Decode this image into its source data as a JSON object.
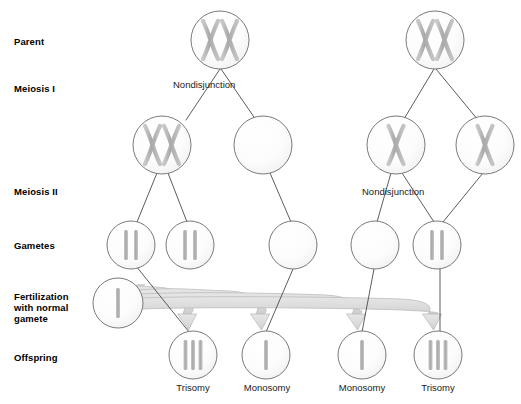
{
  "figure": {
    "background_color": "#ffffff",
    "circle_stroke": "#6b6b6b",
    "circle_fill": "#fbfbfb",
    "chromosome_color": "#b3b3b3",
    "line_color": "#4a4a4a",
    "arrow_fill": "#d9d9d9",
    "arrow_stroke": "#bdbdbd",
    "text_color": "#000000"
  },
  "row_labels": [
    {
      "id": "parent",
      "text": "Parent",
      "x": 14,
      "y": 36
    },
    {
      "id": "meiosis-i",
      "text": "Meiosis I",
      "x": 14,
      "y": 83
    },
    {
      "id": "meiosis-ii",
      "text": "Meiosis II",
      "x": 14,
      "y": 186
    },
    {
      "id": "gametes",
      "text": "Gametes",
      "x": 14,
      "y": 240
    },
    {
      "id": "fertilization",
      "text": "Fertilization\nwith normal\ngamete",
      "x": 14,
      "y": 291
    },
    {
      "id": "offspring",
      "text": "Offspring",
      "x": 14,
      "y": 352
    }
  ],
  "stage_captions": [
    {
      "id": "nondisjunction-meiosis-i",
      "text": "Nondisjunction",
      "x": 173,
      "y": 79
    },
    {
      "id": "nondisjunction-meiosis-ii",
      "text": "Nondisjunction",
      "x": 362,
      "y": 186
    }
  ],
  "outcome_labels": [
    {
      "id": "outcome-1",
      "text": "Trisomy",
      "x": 193,
      "y": 382
    },
    {
      "id": "outcome-2",
      "text": "Monosomy",
      "x": 267,
      "y": 382
    },
    {
      "id": "outcome-3",
      "text": "Monosomy",
      "x": 362,
      "y": 382
    },
    {
      "id": "outcome-4",
      "text": "Trisomy",
      "x": 438,
      "y": 382
    }
  ],
  "cells": [
    {
      "id": "parent-left",
      "name": "parent-cell-left",
      "cx": 220,
      "cy": 40,
      "r": 29,
      "content": "two-chromosomes"
    },
    {
      "id": "parent-right",
      "name": "parent-cell-right",
      "cx": 435,
      "cy": 40,
      "r": 29,
      "content": "two-chromosomes"
    },
    {
      "id": "mi-left-1",
      "name": "meiosis-i-cell-both",
      "cx": 162,
      "cy": 145,
      "r": 29,
      "content": "two-chromosomes"
    },
    {
      "id": "mi-left-2",
      "name": "meiosis-i-cell-empty",
      "cx": 263,
      "cy": 145,
      "r": 29,
      "content": "empty"
    },
    {
      "id": "mi-right-1",
      "name": "meiosis-i-cell-one-left",
      "cx": 396,
      "cy": 145,
      "r": 29,
      "content": "one-chromosome"
    },
    {
      "id": "mi-right-2",
      "name": "meiosis-i-cell-one-right",
      "cx": 485,
      "cy": 145,
      "r": 29,
      "content": "one-chromosome"
    },
    {
      "id": "gamete-1",
      "name": "gamete-disomic-1",
      "cx": 131,
      "cy": 245,
      "r": 24,
      "content": "two-chromatids"
    },
    {
      "id": "gamete-2",
      "name": "gamete-disomic-2",
      "cx": 190,
      "cy": 245,
      "r": 24,
      "content": "two-chromatids"
    },
    {
      "id": "gamete-3",
      "name": "gamete-nullisomic-1",
      "cx": 293,
      "cy": 245,
      "r": 24,
      "content": "empty"
    },
    {
      "id": "gamete-4",
      "name": "gamete-nullisomic-2",
      "cx": 375,
      "cy": 245,
      "r": 24,
      "content": "empty"
    },
    {
      "id": "gamete-5",
      "name": "gamete-disomic-3",
      "cx": 437,
      "cy": 245,
      "r": 24,
      "content": "two-chromatids"
    },
    {
      "id": "normal-gamete",
      "name": "normal-gamete-cell",
      "cx": 118,
      "cy": 303,
      "r": 25,
      "content": "one-chromatid"
    },
    {
      "id": "offspring-1",
      "name": "offspring-trisomy-1",
      "cx": 193,
      "cy": 355,
      "r": 24,
      "content": "three-chromatids"
    },
    {
      "id": "offspring-2",
      "name": "offspring-monosomy-1",
      "cx": 266,
      "cy": 355,
      "r": 24,
      "content": "one-chromatid"
    },
    {
      "id": "offspring-3",
      "name": "offspring-monosomy-2",
      "cx": 362,
      "cy": 355,
      "r": 24,
      "content": "one-chromatid"
    },
    {
      "id": "offspring-4",
      "name": "offspring-trisomy-2",
      "cx": 438,
      "cy": 355,
      "r": 24,
      "content": "three-chromatids"
    }
  ],
  "connectors": [
    {
      "id": "c1",
      "name": "connector-parent-left-to-mi-1",
      "x1": 220,
      "y1": 69,
      "x2": 186,
      "y2": 120
    },
    {
      "id": "c2",
      "name": "connector-parent-left-to-mi-2",
      "x1": 221,
      "y1": 69,
      "x2": 256,
      "y2": 120
    },
    {
      "id": "c3",
      "name": "connector-parent-right-to-mi-1",
      "x1": 434,
      "y1": 69,
      "x2": 404,
      "y2": 119
    },
    {
      "id": "c4",
      "name": "connector-parent-right-to-mi-2",
      "x1": 436,
      "y1": 69,
      "x2": 478,
      "y2": 120
    },
    {
      "id": "c5",
      "name": "connector-mi1-to-gamete-1",
      "x1": 157,
      "y1": 173,
      "x2": 137,
      "y2": 222
    },
    {
      "id": "c6",
      "name": "connector-mi1-to-gamete-2",
      "x1": 168,
      "y1": 173,
      "x2": 187,
      "y2": 222
    },
    {
      "id": "c7",
      "name": "connector-mi2-to-gamete-3",
      "x1": 270,
      "y1": 173,
      "x2": 291,
      "y2": 222
    },
    {
      "id": "c8",
      "name": "connector-mi3-to-gamete-4",
      "x1": 391,
      "y1": 173,
      "x2": 377,
      "y2": 222
    },
    {
      "id": "c9",
      "name": "connector-mi3-to-gamete-5",
      "x1": 402,
      "y1": 173,
      "x2": 434,
      "y2": 222
    },
    {
      "id": "c10",
      "name": "connector-mi4-to-gamete-5",
      "x1": 483,
      "y1": 173,
      "x2": 443,
      "y2": 222
    },
    {
      "id": "c11",
      "name": "connector-gamete1-to-offspring1",
      "x1": 136,
      "y1": 266,
      "x2": 189,
      "y2": 332
    },
    {
      "id": "c12",
      "name": "connector-gamete3-to-offspring2",
      "x1": 293,
      "y1": 269,
      "x2": 266,
      "y2": 332
    },
    {
      "id": "c13",
      "name": "connector-gamete4-to-offspring3",
      "x1": 374,
      "y1": 269,
      "x2": 362,
      "y2": 332
    },
    {
      "id": "c14",
      "name": "connector-gamete5-to-offspring4",
      "x1": 440,
      "y1": 268,
      "x2": 440,
      "y2": 332
    }
  ],
  "fertilization_arrows": [
    {
      "id": "a1",
      "name": "fertilization-arrow-1",
      "to_x": 193,
      "to_y": 330
    },
    {
      "id": "a2",
      "name": "fertilization-arrow-2",
      "to_x": 266,
      "to_y": 330
    },
    {
      "id": "a3",
      "name": "fertilization-arrow-3",
      "to_x": 362,
      "to_y": 330
    },
    {
      "id": "a4",
      "name": "fertilization-arrow-4",
      "to_x": 438,
      "to_y": 330
    }
  ]
}
